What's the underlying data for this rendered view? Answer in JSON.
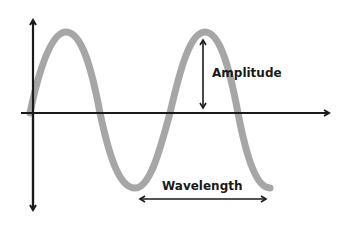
{
  "diagram": {
    "labels": {
      "amplitude": "Amplitude",
      "wavelength": "Wavelength"
    },
    "colors": {
      "wave": "#a6a6a6",
      "axes": "#1a1a1a",
      "background": "#ffffff"
    }
  }
}
